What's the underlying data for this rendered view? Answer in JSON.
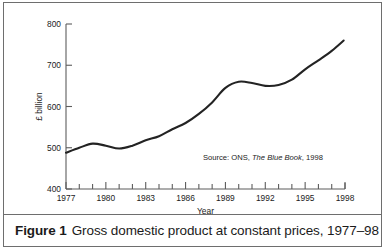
{
  "figure": {
    "caption_number": "Figure 1",
    "caption_text": "Gross domestic product at constant prices, 1977–98"
  },
  "chart_data": {
    "type": "line",
    "title": "",
    "xlabel": "Year",
    "ylabel": "£ billion",
    "xlim": [
      1977,
      1998
    ],
    "ylim": [
      400,
      800
    ],
    "grid": false,
    "legend": null,
    "annotation": {
      "prefix": "Source: ONS, ",
      "italic": "The Blue Book",
      "suffix": ", 1998"
    },
    "y_ticks": [
      400,
      500,
      600,
      700,
      800
    ],
    "y_ticklabels": [
      "400",
      "500",
      "600",
      "700",
      "800"
    ],
    "x_ticks": [
      1977,
      1978,
      1979,
      1980,
      1981,
      1982,
      1983,
      1984,
      1985,
      1986,
      1987,
      1988,
      1989,
      1990,
      1991,
      1992,
      1993,
      1994,
      1995,
      1996,
      1997,
      1998
    ],
    "x_ticklabels_major": [
      "1977",
      "1980",
      "1983",
      "1986",
      "1989",
      "1992",
      "1995",
      "1998"
    ],
    "x_major_values": [
      1977,
      1980,
      1983,
      1986,
      1989,
      1992,
      1995,
      1998
    ],
    "series": [
      {
        "name": "GDP at constant prices",
        "x": [
          1977,
          1978,
          1979,
          1980,
          1981,
          1982,
          1983,
          1984,
          1985,
          1986,
          1987,
          1988,
          1989,
          1990,
          1991,
          1992,
          1993,
          1994,
          1995,
          1996,
          1997
        ],
        "values": [
          488,
          500,
          510,
          505,
          498,
          505,
          518,
          528,
          545,
          560,
          582,
          610,
          645,
          660,
          657,
          650,
          652,
          665,
          690,
          712,
          735
        ]
      }
    ],
    "line_end_value": 760,
    "line_end_x": 1997.9,
    "units": "£ billion",
    "color": "#232323"
  }
}
